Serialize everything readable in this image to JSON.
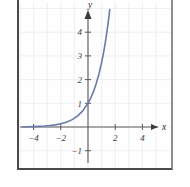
{
  "figure": {
    "name": "exponential-function-graph",
    "background_color": "#ffffff",
    "frame_color": "#4a4a4a",
    "curve_color": "#6b7aa8",
    "grid_color": "#e9e9ef",
    "axis_color": "#5a5a5a"
  },
  "chart_data": {
    "type": "line",
    "title": "",
    "subtitle": "",
    "xlabel": "x",
    "ylabel": "y",
    "xlim": [
      -5.2,
      5.0
    ],
    "ylim": [
      -1.5,
      5.2
    ],
    "grid": true,
    "legend": null,
    "xticks": [
      -4,
      -2,
      2,
      4
    ],
    "xtick_labels": [
      "−4",
      "−2",
      "2",
      "4"
    ],
    "yticks": [
      4,
      3,
      2,
      1,
      -1
    ],
    "ytick_labels": [
      "4",
      "3",
      "2",
      "1",
      "−1"
    ],
    "annotations": [],
    "series": [
      {
        "name": "y = e^x",
        "function": "exponential",
        "x": [
          -5.2,
          -4.8,
          -4.4,
          -4.0,
          -3.6,
          -3.2,
          -2.8,
          -2.4,
          -2.0,
          -1.6,
          -1.2,
          -0.8,
          -0.4,
          0.0,
          0.2,
          0.4,
          0.6,
          0.8,
          1.0,
          1.1,
          1.2,
          1.3,
          1.4,
          1.5,
          1.6
        ],
        "y": [
          0.0055,
          0.0082,
          0.0123,
          0.0183,
          0.0273,
          0.0408,
          0.0608,
          0.0907,
          0.1353,
          0.2019,
          0.3012,
          0.4493,
          0.6703,
          1.0,
          1.2214,
          1.4918,
          1.8221,
          2.2255,
          2.7183,
          3.0042,
          3.3201,
          3.6693,
          4.0552,
          4.4817,
          4.953
        ]
      }
    ]
  },
  "axes": {
    "x_axis_label": "x",
    "y_axis_label": "y",
    "x_arrow": "arrow-right",
    "y_arrow": "arrow-up"
  }
}
